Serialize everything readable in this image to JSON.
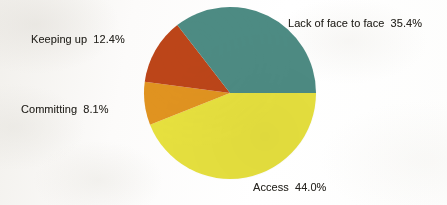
{
  "chart_data": {
    "type": "pie",
    "title": "",
    "subtitle": "",
    "xlabel": "",
    "ylabel": "",
    "legend_position": "none",
    "grid": false,
    "labels_inline": true,
    "total_percent": "99.9",
    "categories": [
      "Access",
      "Committing",
      "Keeping up",
      "Lack of face to face"
    ],
    "values": [
      44.0,
      8.1,
      12.4,
      35.4
    ],
    "slices": [
      {
        "name": "Access",
        "label": "Access  44.0%",
        "category": "Access",
        "value": 44.0,
        "value_text": "44.0%",
        "color": "#e6e03e",
        "start_angle_deg": 0,
        "end_angle_deg": 158.4,
        "label_position": "bottom"
      },
      {
        "name": "Committing",
        "label": "Committing  8.1%",
        "category": "Committing",
        "value": 8.1,
        "value_text": "8.1%",
        "color": "#e09320",
        "start_angle_deg": 158.4,
        "end_angle_deg": 187.56,
        "label_position": "left"
      },
      {
        "name": "Keeping up",
        "label": "Keeping up  12.4%",
        "category": "Keeping up",
        "value": 12.4,
        "value_text": "12.4%",
        "color": "#bc4519",
        "start_angle_deg": 187.56,
        "end_angle_deg": 232.2,
        "label_position": "upper-left"
      },
      {
        "name": "Lack of face to face",
        "label": "Lack of face to face  35.4%",
        "category": "Lack of face to face",
        "value": 35.4,
        "value_text": "35.4%",
        "color": "#4d8b83",
        "start_angle_deg": 232.2,
        "end_angle_deg": 360,
        "label_position": "upper-right"
      }
    ],
    "geometry": {
      "center_x": 87,
      "center_y": 87,
      "radius": 86,
      "start_angle_deg": 0,
      "direction": "clockwise"
    },
    "colors": {
      "access": "#e6e03e",
      "committing": "#e09320",
      "keeping_up": "#bc4519",
      "lack_of_face_to_face": "#4d8b83",
      "background": "#fbfaf9",
      "label_text": "#26241f"
    }
  }
}
